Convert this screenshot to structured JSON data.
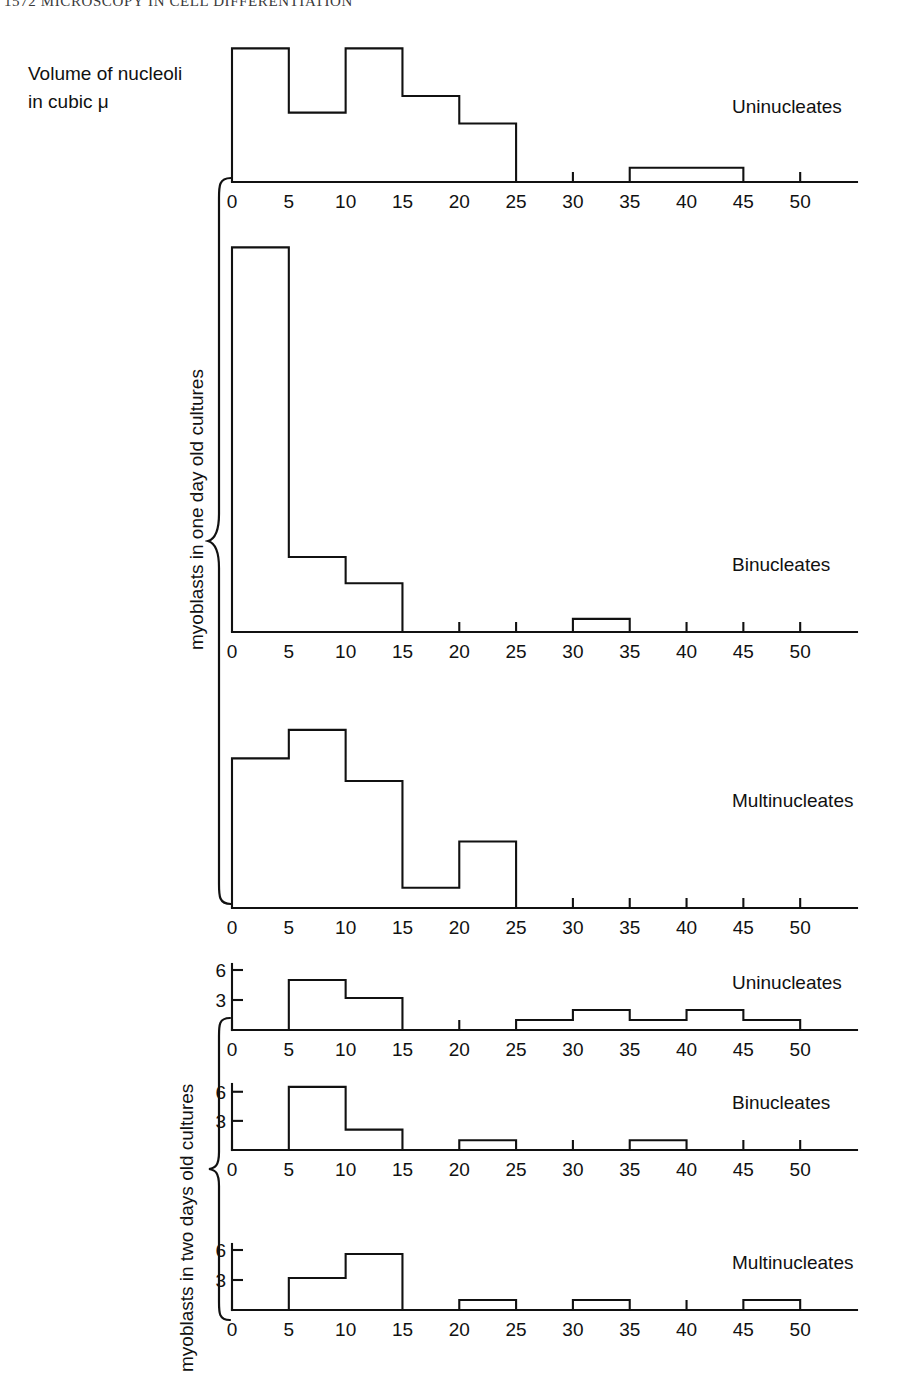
{
  "running_head": "1572  MICROSCOPY IN CELL DIFFERENTIATION",
  "axis_caption": "Volume of nucleoli\nin cubic μ",
  "axis_caption_line1": "Volume of nucleoli",
  "axis_caption_line2": "in cubic μ",
  "group_labels": {
    "one_day": "myoblasts in one day old cultures",
    "two_days": "myoblasts in two days old cultures"
  },
  "x_ticks": [
    "0",
    "5",
    "10",
    "15",
    "20",
    "25",
    "30",
    "35",
    "40",
    "45",
    "50"
  ],
  "y_ticks_lower": [
    "3",
    "6"
  ],
  "chart_data": [
    {
      "type": "bar",
      "id": "uninucleates-one-day",
      "title": "Uninucleates",
      "series_label": "Uninucleates",
      "group": "myoblasts in one day old cultures",
      "xlabel": "Volume of nucleoli in cubic μ",
      "ylabel": "",
      "xlim": [
        0,
        55
      ],
      "xtick_labels": [
        "0",
        "5",
        "10",
        "15",
        "20",
        "25",
        "30",
        "35",
        "40",
        "45",
        "50"
      ],
      "xticks": [
        0,
        5,
        10,
        15,
        20,
        25,
        30,
        35,
        40,
        45,
        50
      ],
      "bin_width": 5,
      "bin_starts": [
        0,
        5,
        10,
        15,
        20,
        25,
        30,
        35,
        40,
        45,
        50
      ],
      "values": [
        16.0,
        8.3,
        16.0,
        10.3,
        7.0,
        0,
        0,
        1.7,
        1.7,
        0,
        0
      ],
      "ylim": [
        0,
        17
      ],
      "y_axis_shown": false,
      "grid": false
    },
    {
      "type": "bar",
      "id": "binucleates-one-day",
      "title": "Binucleates",
      "series_label": "Binucleates",
      "group": "myoblasts in one day old cultures",
      "xlabel": "Volume of nucleoli in cubic μ",
      "ylabel": "",
      "xlim": [
        0,
        55
      ],
      "xtick_labels": [
        "0",
        "5",
        "10",
        "15",
        "20",
        "25",
        "30",
        "35",
        "40",
        "45",
        "50"
      ],
      "xticks": [
        0,
        5,
        10,
        15,
        20,
        25,
        30,
        35,
        40,
        45,
        50
      ],
      "bin_width": 5,
      "bin_starts": [
        0,
        5,
        10,
        15,
        20,
        25,
        30,
        35,
        40,
        45,
        50
      ],
      "values": [
        41.0,
        8.0,
        5.2,
        0,
        0,
        0,
        1.4,
        0,
        0,
        0,
        0
      ],
      "ylim": [
        0,
        42
      ],
      "y_axis_shown": false,
      "grid": false
    },
    {
      "type": "bar",
      "id": "multinucleates-one-day",
      "title": "Multinucleates",
      "series_label": "Multinucleates",
      "group": "myoblasts in one day old cultures",
      "xlabel": "Volume of nucleoli in cubic μ",
      "ylabel": "",
      "xlim": [
        0,
        55
      ],
      "xtick_labels": [
        "0",
        "5",
        "10",
        "15",
        "20",
        "25",
        "30",
        "35",
        "40",
        "45",
        "50"
      ],
      "xticks": [
        0,
        5,
        10,
        15,
        20,
        25,
        30,
        35,
        40,
        45,
        50
      ],
      "bin_width": 5,
      "bin_starts": [
        0,
        5,
        10,
        15,
        20,
        25,
        30,
        35,
        40,
        45,
        50
      ],
      "values": [
        12.6,
        15.0,
        10.7,
        1.7,
        5.6,
        0,
        0,
        0,
        0,
        0,
        0
      ],
      "ylim": [
        0,
        16
      ],
      "y_axis_shown": false,
      "grid": false
    },
    {
      "type": "bar",
      "id": "uninucleates-two-days",
      "title": "Uninucleates",
      "series_label": "Uninucleates",
      "group": "myoblasts in two days old cultures",
      "xlabel": "Volume of nucleoli in cubic μ",
      "ylabel": "",
      "xlim": [
        0,
        55
      ],
      "xtick_labels": [
        "0",
        "5",
        "10",
        "15",
        "20",
        "25",
        "30",
        "35",
        "40",
        "45",
        "50"
      ],
      "xticks": [
        0,
        5,
        10,
        15,
        20,
        25,
        30,
        35,
        40,
        45,
        50
      ],
      "ytick_labels": [
        "3",
        "6"
      ],
      "yticks": [
        3,
        6
      ],
      "bin_width": 5,
      "bin_starts": [
        0,
        5,
        10,
        15,
        20,
        25,
        30,
        35,
        40,
        45,
        50
      ],
      "values": [
        0,
        5.0,
        3.2,
        0,
        0,
        1.0,
        2.0,
        1.0,
        2.0,
        1.0,
        0
      ],
      "ylim": [
        0,
        6.6
      ],
      "y_axis_shown": true,
      "grid": false
    },
    {
      "type": "bar",
      "id": "binucleates-two-days",
      "title": "Binucleates",
      "series_label": "Binucleates",
      "group": "myoblasts in two days old cultures",
      "xlabel": "Volume of nucleoli in cubic μ",
      "ylabel": "",
      "xlim": [
        0,
        55
      ],
      "xtick_labels": [
        "0",
        "5",
        "10",
        "15",
        "20",
        "25",
        "30",
        "35",
        "40",
        "45",
        "50"
      ],
      "xticks": [
        0,
        5,
        10,
        15,
        20,
        25,
        30,
        35,
        40,
        45,
        50
      ],
      "ytick_labels": [
        "3",
        "6"
      ],
      "yticks": [
        3,
        6
      ],
      "bin_width": 5,
      "bin_starts": [
        0,
        5,
        10,
        15,
        20,
        25,
        30,
        35,
        40,
        45,
        50
      ],
      "values": [
        0,
        6.5,
        2.1,
        0,
        1.0,
        0,
        0,
        1.0,
        0,
        0,
        0
      ],
      "ylim": [
        0,
        6.8
      ],
      "y_axis_shown": true,
      "grid": false
    },
    {
      "type": "bar",
      "id": "multinucleates-two-days",
      "title": "Multinucleates",
      "series_label": "Multinucleates",
      "group": "myoblasts in two days old cultures",
      "xlabel": "Volume of nucleoli in cubic μ",
      "ylabel": "",
      "xlim": [
        0,
        55
      ],
      "xtick_labels": [
        "0",
        "5",
        "10",
        "15",
        "20",
        "25",
        "30",
        "35",
        "40",
        "45",
        "50"
      ],
      "xticks": [
        0,
        5,
        10,
        15,
        20,
        25,
        30,
        35,
        40,
        45,
        50
      ],
      "ytick_labels": [
        "3",
        "6"
      ],
      "yticks": [
        3,
        6
      ],
      "bin_width": 5,
      "bin_starts": [
        0,
        5,
        10,
        15,
        20,
        25,
        30,
        35,
        40,
        45,
        50
      ],
      "values": [
        0,
        3.2,
        5.6,
        0,
        1.0,
        0,
        1.0,
        0,
        0,
        1.0,
        0
      ],
      "ylim": [
        0,
        6.6
      ],
      "y_axis_shown": true,
      "grid": false
    }
  ]
}
